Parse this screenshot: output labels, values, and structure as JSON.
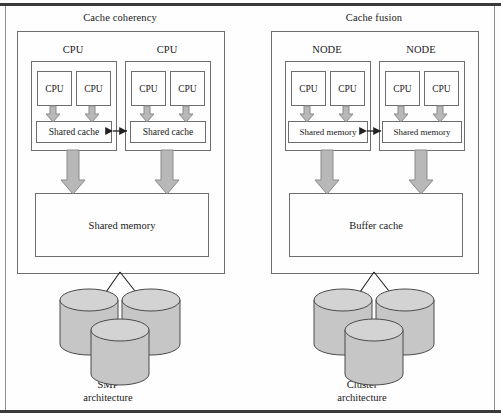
{
  "figure": {
    "left_panel": {
      "title": "Cache coherency",
      "groups": [
        {
          "label": "CPU",
          "cpus": [
            "CPU",
            "CPU"
          ],
          "memory_label": "Shared cache"
        },
        {
          "label": "CPU",
          "cpus": [
            "CPU",
            "CPU"
          ],
          "memory_label": "Shared cache"
        }
      ],
      "shared_block_label": "Shared memory",
      "storage_label_line1": "SMP",
      "storage_label_line2": "architecture",
      "disk_count": 3
    },
    "right_panel": {
      "title": "Cache fusion",
      "groups": [
        {
          "label": "NODE",
          "cpus": [
            "CPU",
            "CPU"
          ],
          "memory_label": "Shared memory"
        },
        {
          "label": "NODE",
          "cpus": [
            "CPU",
            "CPU"
          ],
          "memory_label": "Shared memory"
        }
      ],
      "shared_block_label": "Buffer cache",
      "storage_label_line1": "Cluster",
      "storage_label_line2": "architecture",
      "disk_count": 3
    },
    "colors": {
      "line": "#6e6e6e",
      "frame": "#3a3a3a",
      "arrow_fill": "#b8b8b8",
      "arrow_stroke": "#8a8a8a",
      "disk_fill": "#c6c6c6",
      "disk_top_fill": "#d3d3d3",
      "disk_stroke": "#4a4a4a",
      "text": "#1a1a1a",
      "background": "#fefefe"
    },
    "icons": {
      "down_arrow": "down-arrow-icon",
      "double_arrow": "double-headed-arrow-icon",
      "disk": "disk-cylinder-icon"
    }
  }
}
